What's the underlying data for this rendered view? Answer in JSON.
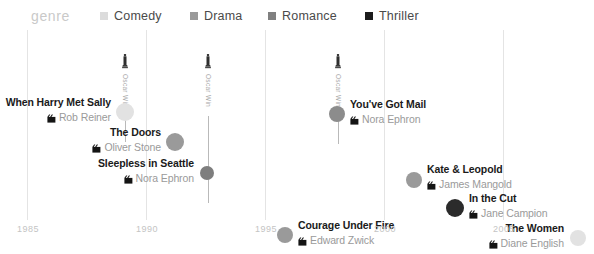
{
  "legend": {
    "title": "genre",
    "title_x": 31,
    "items": [
      {
        "label": "Comedy",
        "color": "#dcdcdc",
        "x": 100
      },
      {
        "label": "Drama",
        "color": "#9a9a9a",
        "x": 190
      },
      {
        "label": "Romance",
        "color": "#808080",
        "x": 268
      },
      {
        "label": "Thriller",
        "color": "#1c1c1c",
        "x": 365
      }
    ]
  },
  "axis": {
    "label": "year",
    "ticks": [
      {
        "label": "1985",
        "x": 27
      },
      {
        "label": "1990",
        "x": 146
      },
      {
        "label": "1995",
        "x": 265
      },
      {
        "label": "2000",
        "x": 384
      },
      {
        "label": "2005",
        "x": 503
      }
    ],
    "gridline_color": "#e4e4e4",
    "tick_label_color": "#c4c4c4"
  },
  "chart_data": {
    "type": "scatter",
    "title": "",
    "xlabel": "year",
    "ylabel": "",
    "xlim": [
      1985,
      2008
    ],
    "legend_position": "top",
    "grid": true,
    "categories": [
      "Comedy",
      "Drama",
      "Romance",
      "Thriller"
    ],
    "category_colors": {
      "Comedy": "#dcdcdc",
      "Drama": "#9a9a9a",
      "Romance": "#808080",
      "Thriller": "#1c1c1c"
    },
    "points": [
      {
        "title": "When Harry Met Sally",
        "director": "Rob Reiner",
        "genre": "Comedy",
        "year": 1989,
        "cx": 125,
        "cy": 82,
        "r": 9,
        "color": "#e2e2e2",
        "label_side": "left",
        "label_x": 111,
        "label_y": 67,
        "oscar": true
      },
      {
        "title": "The Doors",
        "director": "Oliver Stone",
        "genre": "Drama",
        "year": 1991,
        "cx": 175,
        "cy": 112,
        "r": 9,
        "color": "#9a9a9a",
        "label_side": "left",
        "label_x": 161,
        "label_y": 97,
        "oscar": false
      },
      {
        "title": "Sleepless in Seattle",
        "director": "Nora Ephron",
        "genre": "Romance",
        "year": 1993,
        "cx": 207,
        "cy": 143,
        "r": 7,
        "color": "#7e7e7e",
        "label_side": "left",
        "label_x": 194,
        "label_y": 128,
        "oscar": true
      },
      {
        "title": "You've Got Mail",
        "director": "Nora Ephron",
        "genre": "Romance",
        "year": 1998,
        "cx": 337,
        "cy": 84,
        "r": 8,
        "color": "#8c8c8c",
        "label_side": "right",
        "label_x": 350,
        "label_y": 69,
        "oscar": true
      },
      {
        "title": "Kate & Leopold",
        "director": "James Mangold",
        "genre": "Drama",
        "year": 2001,
        "cx": 414,
        "cy": 150,
        "r": 8,
        "color": "#9a9a9a",
        "label_side": "right",
        "label_x": 427,
        "label_y": 134,
        "oscar": false
      },
      {
        "title": "In the Cut",
        "director": "Jane Campion",
        "genre": "Thriller",
        "year": 2003,
        "cx": 455,
        "cy": 178,
        "r": 9,
        "color": "#2b2b2b",
        "label_side": "right",
        "label_x": 469,
        "label_y": 163,
        "oscar": false
      },
      {
        "title": "Courage Under Fire",
        "director": "Edward Zwick",
        "genre": "Drama",
        "year": 1996,
        "cx": 285,
        "cy": 205,
        "r": 8,
        "color": "#9a9a9a",
        "label_side": "right",
        "label_x": 298,
        "label_y": 190,
        "oscar": false
      },
      {
        "title": "The Women",
        "director": "Diane English",
        "genre": "Comedy",
        "year": 2008,
        "cx": 578,
        "cy": 208,
        "r": 8,
        "color": "#e2e2e2",
        "label_side": "left",
        "label_x": 564,
        "label_y": 193,
        "oscar": false
      }
    ],
    "annotations": [
      {
        "text": "Oscar Win",
        "x": 124,
        "top": 38,
        "stem_bottom": 112
      },
      {
        "text": "Oscar Win",
        "x": 207,
        "top": 38,
        "stem_bottom": 173
      },
      {
        "text": "Oscar Win",
        "x": 337,
        "top": 38,
        "stem_bottom": 114
      }
    ]
  }
}
